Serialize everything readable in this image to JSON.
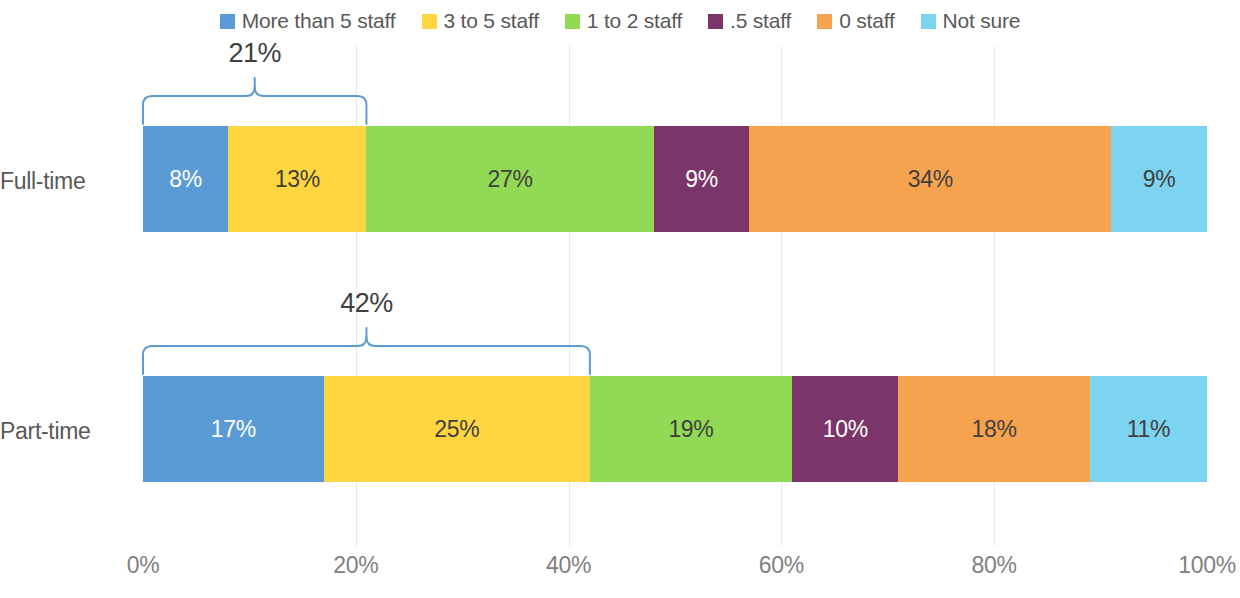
{
  "legend": {
    "items": [
      {
        "label": "More than 5 staff",
        "color": "#5B9BD5",
        "key": "more_than_5"
      },
      {
        "label": "3 to 5 staff",
        "color": "#FFD63F",
        "key": "3_to_5"
      },
      {
        "label": "1 to 2 staff",
        "color": "#92D955",
        "key": "1_to_2"
      },
      {
        "label": ".5 staff",
        "color": "#7B3568",
        "key": "half"
      },
      {
        "label": "0 staff",
        "color": "#F5A34E",
        "key": "zero"
      },
      {
        "label": "Not sure",
        "color": "#7DD4F0",
        "key": "not_sure"
      }
    ]
  },
  "categories": [
    "Full-time",
    "Part-time"
  ],
  "axis": {
    "ticks": [
      "0%",
      "20%",
      "40%",
      "60%",
      "80%",
      "100%"
    ],
    "tick_values": [
      0,
      20,
      40,
      60,
      80,
      100
    ]
  },
  "annotations": [
    {
      "row": "Full-time",
      "value": "21%",
      "span_start": 0,
      "span_end": 21,
      "note": "More than 5 staff + 3 to 5 staff"
    },
    {
      "row": "Part-time",
      "value": "42%",
      "span_start": 0,
      "span_end": 42,
      "note": "More than 5 staff + 3 to 5 staff"
    }
  ],
  "brace_color": "#5B9BD5",
  "chart_data": {
    "type": "bar",
    "orientation": "horizontal",
    "stacked": true,
    "stack_mode": "percent",
    "title": "",
    "subtitle": "",
    "xlabel": "",
    "ylabel": "",
    "xlim": [
      0,
      100
    ],
    "grid": true,
    "grid_axis": "x",
    "legend_position": "top",
    "categories": [
      "Full-time",
      "Part-time"
    ],
    "series": [
      {
        "name": "More than 5 staff",
        "color": "#5B9BD5",
        "values": [
          8,
          17
        ],
        "labels": [
          "8%",
          "17%"
        ],
        "label_colors": [
          "#ffffff",
          "#ffffff"
        ]
      },
      {
        "name": "3 to 5 staff",
        "color": "#FFD63F",
        "values": [
          13,
          25
        ],
        "labels": [
          "13%",
          "25%"
        ],
        "label_colors": [
          "#3f3f3f",
          "#3f3f3f"
        ]
      },
      {
        "name": "1 to 2 staff",
        "color": "#92D955",
        "values": [
          27,
          19
        ],
        "labels": [
          "27%",
          "19%"
        ],
        "label_colors": [
          "#3f3f3f",
          "#3f3f3f"
        ]
      },
      {
        "name": ".5 staff",
        "color": "#7B3568",
        "values": [
          9,
          10
        ],
        "labels": [
          "9%",
          "10%"
        ],
        "label_colors": [
          "#ffffff",
          "#ffffff"
        ]
      },
      {
        "name": "0 staff",
        "color": "#F5A34E",
        "values": [
          34,
          18
        ],
        "labels": [
          "34%",
          "18%"
        ],
        "label_colors": [
          "#3f3f3f",
          "#3f3f3f"
        ]
      },
      {
        "name": "Not sure",
        "color": "#7DD4F0",
        "values": [
          9,
          11
        ],
        "labels": [
          "9%",
          "11%"
        ],
        "label_colors": [
          "#3f3f3f",
          "#3f3f3f"
        ]
      }
    ],
    "annotations": [
      {
        "category": "Full-time",
        "text": "21%",
        "spans": [
          "More than 5 staff",
          "3 to 5 staff"
        ],
        "from": 0,
        "to": 21
      },
      {
        "category": "Part-time",
        "text": "42%",
        "spans": [
          "More than 5 staff",
          "3 to 5 staff"
        ],
        "from": 0,
        "to": 42
      }
    ]
  }
}
